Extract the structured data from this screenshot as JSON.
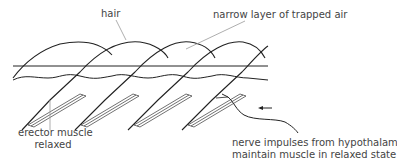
{
  "diagram": {
    "labels": {
      "hair": "hair",
      "trapped_air": "narrow layer of trapped air",
      "erector_line1": "erector muscle",
      "erector_line2": "relaxed",
      "nerve_line1": "nerve impulses from hypothalamus",
      "nerve_line2": "maintain muscle in relaxed state"
    },
    "colors": {
      "line": "#222222",
      "leader": "#999999",
      "text": "#444444"
    }
  }
}
